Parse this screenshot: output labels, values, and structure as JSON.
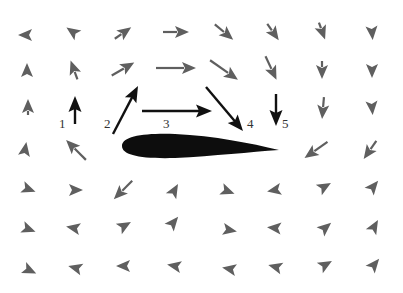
{
  "colors": {
    "field_arrow": "#5f5f5f",
    "highlight_arrow": "#111111",
    "airfoil": "#0d0d0d",
    "label": "#333333",
    "background": "#ffffff"
  },
  "airfoil": {
    "leading_edge": [
      122,
      146
    ],
    "trailing_edge": [
      278,
      150
    ],
    "max_thickness_px": 22
  },
  "highlight_arrows": [
    {
      "id": "1",
      "label": "1",
      "from": [
        75,
        124
      ],
      "to": [
        75,
        96
      ],
      "label_pos": [
        59,
        117
      ]
    },
    {
      "id": "2",
      "label": "2",
      "from": [
        113,
        134
      ],
      "to": [
        138,
        86
      ],
      "label_pos": [
        104,
        117
      ]
    },
    {
      "id": "3",
      "label": "3",
      "from": [
        142,
        111
      ],
      "to": [
        212,
        111
      ],
      "label_pos": [
        163,
        117
      ]
    },
    {
      "id": "4",
      "label": "4",
      "from": [
        206,
        87
      ],
      "to": [
        243,
        131
      ],
      "label_pos": [
        247,
        117
      ]
    },
    {
      "id": "5",
      "label": "5",
      "from": [
        276,
        94
      ],
      "to": [
        276,
        126
      ],
      "label_pos": [
        282,
        117
      ]
    }
  ],
  "field_arrows": [
    {
      "x": 25,
      "y": 35,
      "angle": 180,
      "len": 14,
      "tail": 0
    },
    {
      "x": 73,
      "y": 32,
      "angle": 215,
      "len": 16,
      "tail": 0
    },
    {
      "x": 123,
      "y": 33,
      "angle": 325,
      "len": 20,
      "tail": 6
    },
    {
      "x": 176,
      "y": 32,
      "angle": 0,
      "len": 26,
      "tail": 12
    },
    {
      "x": 224,
      "y": 32,
      "angle": 40,
      "len": 24,
      "tail": 10
    },
    {
      "x": 273,
      "y": 32,
      "angle": 55,
      "len": 20,
      "tail": 6
    },
    {
      "x": 322,
      "y": 31,
      "angle": 70,
      "len": 18,
      "tail": 3
    },
    {
      "x": 372,
      "y": 32,
      "angle": 85,
      "len": 16,
      "tail": 0
    },
    {
      "x": 27,
      "y": 70,
      "angle": 270,
      "len": 14,
      "tail": 0
    },
    {
      "x": 74,
      "y": 70,
      "angle": 250,
      "len": 20,
      "tail": 6
    },
    {
      "x": 123,
      "y": 69,
      "angle": 330,
      "len": 26,
      "tail": 12
    },
    {
      "x": 176,
      "y": 68,
      "angle": 0,
      "len": 40,
      "tail": 26
    },
    {
      "x": 224,
      "y": 70,
      "angle": 35,
      "len": 34,
      "tail": 20
    },
    {
      "x": 271,
      "y": 68,
      "angle": 65,
      "len": 26,
      "tail": 12
    },
    {
      "x": 322,
      "y": 70,
      "angle": 90,
      "len": 18,
      "tail": 4
    },
    {
      "x": 372,
      "y": 70,
      "angle": 90,
      "len": 16,
      "tail": 0
    },
    {
      "x": 28,
      "y": 107,
      "angle": 270,
      "len": 16,
      "tail": 4
    },
    {
      "x": 323,
      "y": 108,
      "angle": 95,
      "len": 22,
      "tail": 8
    },
    {
      "x": 372,
      "y": 107,
      "angle": 85,
      "len": 16,
      "tail": 0
    },
    {
      "x": 25,
      "y": 150,
      "angle": 280,
      "len": 16,
      "tail": 0
    },
    {
      "x": 76,
      "y": 150,
      "angle": 225,
      "len": 28,
      "tail": 14
    },
    {
      "x": 316,
      "y": 150,
      "angle": 145,
      "len": 28,
      "tail": 14
    },
    {
      "x": 370,
      "y": 150,
      "angle": 125,
      "len": 22,
      "tail": 8
    },
    {
      "x": 28,
      "y": 189,
      "angle": 20,
      "len": 16,
      "tail": 0
    },
    {
      "x": 75,
      "y": 190,
      "angle": 0,
      "len": 16,
      "tail": 0
    },
    {
      "x": 123,
      "y": 190,
      "angle": 135,
      "len": 26,
      "tail": 12
    },
    {
      "x": 174,
      "y": 191,
      "angle": 300,
      "len": 16,
      "tail": 0
    },
    {
      "x": 227,
      "y": 191,
      "angle": 20,
      "len": 16,
      "tail": 0
    },
    {
      "x": 275,
      "y": 190,
      "angle": 170,
      "len": 16,
      "tail": 0
    },
    {
      "x": 324,
      "y": 187,
      "angle": 330,
      "len": 16,
      "tail": 0
    },
    {
      "x": 373,
      "y": 187,
      "angle": 310,
      "len": 16,
      "tail": 0
    },
    {
      "x": 28,
      "y": 229,
      "angle": 20,
      "len": 16,
      "tail": 0
    },
    {
      "x": 74,
      "y": 228,
      "angle": 190,
      "len": 16,
      "tail": 0
    },
    {
      "x": 124,
      "y": 226,
      "angle": 330,
      "len": 16,
      "tail": 0
    },
    {
      "x": 173,
      "y": 223,
      "angle": 310,
      "len": 16,
      "tail": 0
    },
    {
      "x": 229,
      "y": 230,
      "angle": 10,
      "len": 16,
      "tail": 0
    },
    {
      "x": 275,
      "y": 228,
      "angle": 185,
      "len": 16,
      "tail": 0
    },
    {
      "x": 325,
      "y": 228,
      "angle": 320,
      "len": 16,
      "tail": 0
    },
    {
      "x": 374,
      "y": 227,
      "angle": 300,
      "len": 16,
      "tail": 0
    },
    {
      "x": 29,
      "y": 270,
      "angle": 25,
      "len": 16,
      "tail": 0
    },
    {
      "x": 76,
      "y": 268,
      "angle": 195,
      "len": 16,
      "tail": 0
    },
    {
      "x": 124,
      "y": 266,
      "angle": 180,
      "len": 16,
      "tail": 0
    },
    {
      "x": 175,
      "y": 266,
      "angle": 190,
      "len": 16,
      "tail": 0
    },
    {
      "x": 230,
      "y": 269,
      "angle": 190,
      "len": 16,
      "tail": 0
    },
    {
      "x": 276,
      "y": 267,
      "angle": 195,
      "len": 16,
      "tail": 0
    },
    {
      "x": 325,
      "y": 265,
      "angle": 330,
      "len": 16,
      "tail": 0
    },
    {
      "x": 374,
      "y": 265,
      "angle": 310,
      "len": 16,
      "tail": 0
    }
  ]
}
